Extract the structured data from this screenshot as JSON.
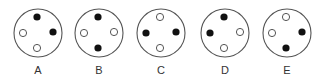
{
  "figure": {
    "type": "multiple-choice-pattern",
    "colors": {
      "outline": "#555555",
      "filled": "#111111",
      "hollow_fill": "#ffffff",
      "label": "#333333"
    },
    "options": [
      {
        "label": "A",
        "cx": 38,
        "cy": 33,
        "dots": {
          "top": "filled",
          "right": "filled",
          "bottom": "hollow",
          "left": "hollow"
        }
      },
      {
        "label": "B",
        "cx": 99,
        "cy": 33,
        "dots": {
          "top": "filled",
          "right": "hollow",
          "bottom": "filled",
          "left": "hollow"
        }
      },
      {
        "label": "C",
        "cx": 161,
        "cy": 33,
        "dots": {
          "top": "hollow",
          "right": "filled",
          "bottom": "hollow",
          "left": "filled"
        }
      },
      {
        "label": "D",
        "cx": 225,
        "cy": 33,
        "dots": {
          "top": "filled",
          "right": "hollow",
          "bottom": "hollow",
          "left": "filled"
        }
      },
      {
        "label": "E",
        "cx": 287,
        "cy": 33,
        "dots": {
          "top": "hollow",
          "right": "filled",
          "bottom": "filled",
          "left": "hollow"
        }
      }
    ]
  }
}
